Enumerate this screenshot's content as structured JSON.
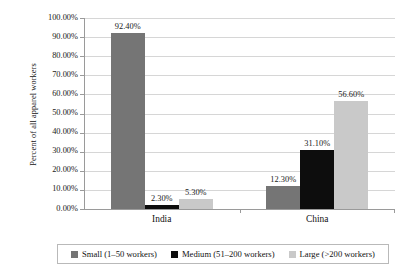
{
  "chart_data": {
    "type": "bar",
    "title": "",
    "subtitle": "",
    "xlabel": "",
    "ylabel": "Percent of all apparel workers",
    "ylim": [
      0,
      1.0
    ],
    "y_tick_step": 0.1,
    "y_tick_labels": [
      "0.00%",
      "10.00%",
      "20.00%",
      "30.00%",
      "40.00%",
      "50.00%",
      "60.00%",
      "70.00%",
      "80.00%",
      "90.00%",
      "100.00%"
    ],
    "grid": true,
    "legend_position": "bottom",
    "categories": [
      "India",
      "China"
    ],
    "series": [
      {
        "name": "Small (1–50 workers)",
        "color": "#757575",
        "values": [
          0.924,
          0.123
        ],
        "labels": [
          "92.40%",
          "12.30%"
        ]
      },
      {
        "name": "Medium (51–200 workers)",
        "color": "#0d0d0d",
        "values": [
          0.023,
          0.311
        ],
        "labels": [
          "2.30%",
          "31.10%"
        ]
      },
      {
        "name": "Large (>200 workers)",
        "color": "#c9c9c9",
        "values": [
          0.053,
          0.566
        ],
        "labels": [
          "5.30%",
          "56.60%"
        ]
      }
    ]
  },
  "axis": {
    "y_title": "Percent of all apparel workers"
  },
  "colors": {
    "axis": "#9a9a9a",
    "grid": "#d6d6d6",
    "text": "#1a1a1a",
    "background": "#ffffff",
    "legend_border": "#b9b9b9"
  }
}
